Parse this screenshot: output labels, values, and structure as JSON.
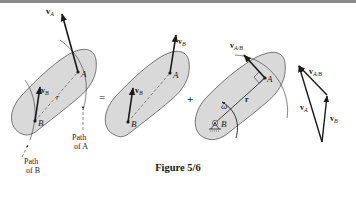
{
  "figure": {
    "caption": "Figure 5/6",
    "operators": {
      "equals": "=",
      "plus": "+"
    }
  },
  "panels": {
    "total_motion": {
      "labels": {
        "point_a": "A",
        "point_b": "B",
        "vel_a": "v",
        "vel_a_sub": "A",
        "vel_b": "v",
        "vel_b_sub": "B",
        "position": "r",
        "path_a_line1": "Path",
        "path_a_line2": "of A",
        "path_b_line1": "Path",
        "path_b_line2": "of B"
      }
    },
    "translation": {
      "labels": {
        "point_a": "A",
        "point_b": "B",
        "vel_b_top": "v",
        "vel_b_top_sub": "B",
        "vel_b": "v",
        "vel_b_sub": "B"
      }
    },
    "rotation": {
      "labels": {
        "point_a": "A",
        "point_b": "B",
        "vel_ab": "v",
        "vel_ab_sub": "A/B",
        "position": "r",
        "omega": "ω"
      }
    },
    "vector_triangle": {
      "labels": {
        "vel_a": "v",
        "vel_a_sub": "A",
        "vel_b": "v",
        "vel_b_sub": "B",
        "vel_ab": "v",
        "vel_ab_sub": "A/B"
      }
    }
  },
  "colors": {
    "body_fill": "#d9d9d9",
    "stroke": "#1a1a1a",
    "header_bar": "#8a8a8a"
  }
}
